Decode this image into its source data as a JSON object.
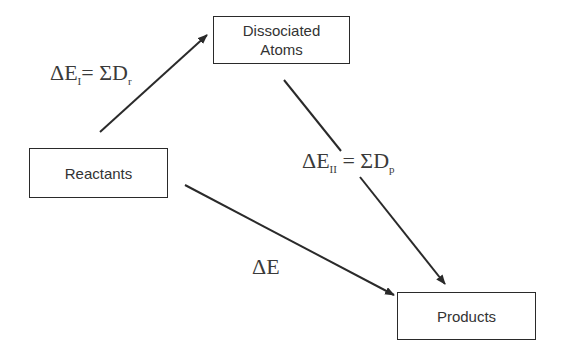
{
  "diagram": {
    "type": "thermochemical cycle",
    "nodes": {
      "reactants": {
        "label": "Reactants"
      },
      "dissociated_atoms": {
        "label_line1": "Dissociated",
        "label_line2": "Atoms"
      },
      "products": {
        "label": "Products"
      }
    },
    "edges": {
      "step_one": {
        "from": "Reactants",
        "to": "Dissociated Atoms",
        "label_prefix": "ΔE",
        "label_sub": "I",
        "label_eq": "= ΣD",
        "label_sub2": "r"
      },
      "step_two": {
        "from": "Dissociated Atoms",
        "to": "Products",
        "label_prefix": "ΔE",
        "label_sub": "II",
        "label_eq": " = ΣD",
        "label_sub2": "p"
      },
      "overall": {
        "from": "Reactants",
        "to": "Products",
        "label": "ΔE"
      }
    },
    "colors": {
      "line": "#2a2a2a",
      "text": "#333333",
      "background": "#ffffff"
    }
  }
}
